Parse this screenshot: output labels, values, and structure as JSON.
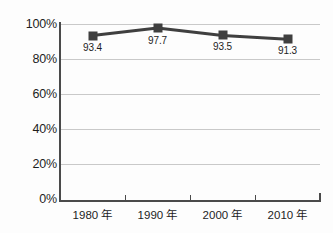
{
  "chart_data": {
    "type": "line",
    "title": "",
    "xlabel": "",
    "ylabel": "",
    "categories": [
      "1980 年",
      "1990 年",
      "2000 年",
      "2010 年"
    ],
    "values": [
      93.4,
      97.7,
      93.5,
      91.3
    ],
    "point_labels": [
      "93.4",
      "97.7",
      "93.5",
      "91.3"
    ],
    "ylim": [
      0,
      100
    ],
    "yticks": [
      0,
      20,
      40,
      60,
      80,
      100
    ],
    "ytick_labels": [
      "0%",
      "20%",
      "40%",
      "60%",
      "80%",
      "100%"
    ],
    "grid": "horizontal",
    "legend": "none",
    "series": [
      {
        "name": "",
        "values": [
          93.4,
          97.7,
          93.5,
          91.3
        ],
        "marker": "square",
        "color": "#3f3f3f"
      }
    ],
    "colors": {
      "line": "#3f3f3f",
      "marker": "#3f3f3f",
      "gridline": "#c9c9c9",
      "axis": "#4a4a4a",
      "text": "#1d1d1d",
      "background": "#fdfdfd"
    }
  }
}
